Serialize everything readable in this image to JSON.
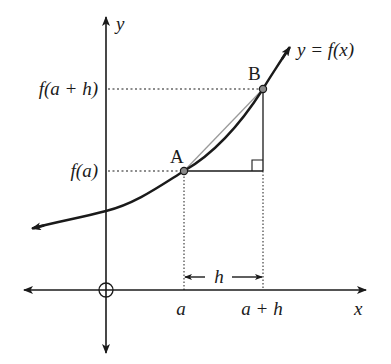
{
  "diagram": {
    "axes": {
      "y_label": "y",
      "x_label": "x",
      "origin_symbol": "O"
    },
    "curve_label": "y = f(x)",
    "points": {
      "A": "A",
      "B": "B"
    },
    "y_ticks": {
      "upper": "f(a + h)",
      "lower": "f(a)"
    },
    "x_ticks": {
      "left": "a",
      "right": "a + h"
    },
    "interval_label": "h",
    "colors": {
      "stroke": "#1a1a1a",
      "point_fill": "#8a8a8a",
      "chord": "#9a9a9a"
    }
  }
}
